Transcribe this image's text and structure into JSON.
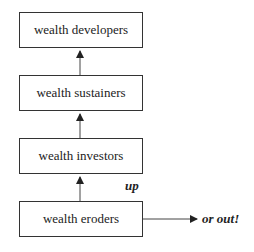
{
  "diagram": {
    "type": "flow",
    "direction": "bottom-to-top",
    "nodes": [
      {
        "id": "developers",
        "label": "wealth developers"
      },
      {
        "id": "sustainers",
        "label": "wealth sustainers"
      },
      {
        "id": "investors",
        "label": "wealth investors"
      },
      {
        "id": "eroders",
        "label": "wealth eroders"
      }
    ],
    "edges": [
      {
        "from": "eroders",
        "to": "investors"
      },
      {
        "from": "investors",
        "to": "sustainers"
      },
      {
        "from": "sustainers",
        "to": "developers"
      },
      {
        "from": "eroders",
        "to": "out"
      }
    ],
    "annotations": {
      "up": "up",
      "out": "or out!"
    }
  }
}
